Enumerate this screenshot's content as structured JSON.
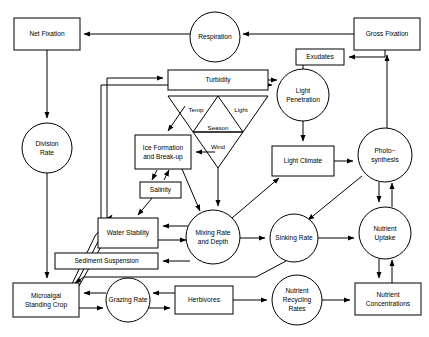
{
  "diagram": {
    "style": {
      "line_color": "#000000",
      "fill_color": "#ffffff",
      "background": "#ffffff"
    },
    "nodes": [
      {
        "id": "net_fixation",
        "label": "Net Fixation",
        "shape": "box",
        "x": 14,
        "y": 18,
        "w": 66,
        "h": 32
      },
      {
        "id": "respiration",
        "label": "Respiration",
        "shape": "circle",
        "cx": 215,
        "cy": 37,
        "r": 25
      },
      {
        "id": "gross_fixation",
        "label": "Gross Fixation",
        "shape": "box",
        "x": 354,
        "y": 18,
        "w": 66,
        "h": 32
      },
      {
        "id": "exudates",
        "label": "Exudates",
        "shape": "box",
        "x": 296,
        "y": 49,
        "w": 48,
        "h": 16
      },
      {
        "id": "turbidity",
        "label": "Turbidity",
        "shape": "box",
        "x": 168,
        "y": 70,
        "w": 100,
        "h": 20
      },
      {
        "id": "light_penetration",
        "label": "Light\nPenetration",
        "shape": "circle",
        "cx": 303,
        "cy": 95,
        "r": 26
      },
      {
        "id": "division_rate",
        "label": "Division\nRate",
        "shape": "circle",
        "cx": 47,
        "cy": 148,
        "r": 25
      },
      {
        "id": "ice_formation",
        "label": "Ice Formation\nand Break-up",
        "shape": "box",
        "x": 135,
        "y": 135,
        "w": 56,
        "h": 34
      },
      {
        "id": "light_climate",
        "label": "Light Climate",
        "shape": "box",
        "x": 272,
        "y": 146,
        "w": 62,
        "h": 30
      },
      {
        "id": "photosynthesis",
        "label": "Photo−\nsynthesis",
        "shape": "circle",
        "cx": 385,
        "cy": 155,
        "r": 27
      },
      {
        "id": "salinity",
        "label": "Salinity",
        "shape": "box",
        "x": 140,
        "y": 182,
        "w": 41,
        "h": 16
      },
      {
        "id": "water_stability",
        "label": "Water Stability",
        "shape": "box",
        "x": 98,
        "y": 218,
        "w": 60,
        "h": 30
      },
      {
        "id": "mixing_rate",
        "label": "Mixing Rate\nand Depth",
        "shape": "circle",
        "cx": 213,
        "cy": 237,
        "r": 27
      },
      {
        "id": "sinking_rate",
        "label": "Sinking Rate",
        "shape": "circle",
        "cx": 294,
        "cy": 238,
        "r": 24
      },
      {
        "id": "nutrient_uptake",
        "label": "Nutrient\nUptake",
        "shape": "circle",
        "cx": 385,
        "cy": 233,
        "r": 26
      },
      {
        "id": "sediment_suspension",
        "label": "Sediment Suspension",
        "shape": "box",
        "x": 55,
        "y": 253,
        "w": 103,
        "h": 16
      },
      {
        "id": "microalgal_standing_crop",
        "label": "Microalgal\nStanding Crop",
        "shape": "box",
        "x": 13,
        "y": 283,
        "w": 66,
        "h": 34
      },
      {
        "id": "grazing_rate",
        "label": "Grazing Rate",
        "shape": "circle",
        "cx": 128,
        "cy": 300,
        "r": 22
      },
      {
        "id": "herbivores",
        "label": "Herbivores",
        "shape": "box",
        "x": 175,
        "y": 286,
        "w": 58,
        "h": 28
      },
      {
        "id": "nutrient_recycling",
        "label": "Nutrient\nRecycling\nRates",
        "shape": "circle",
        "cx": 297,
        "cy": 300,
        "r": 25
      },
      {
        "id": "nutrient_concentrations",
        "label": "Nutrient\nConcentrations",
        "shape": "box",
        "x": 355,
        "y": 283,
        "w": 66,
        "h": 32
      }
    ],
    "triangle_labels": [
      {
        "id": "temp",
        "label": "Temp",
        "x": 196,
        "y": 110
      },
      {
        "id": "light",
        "label": "Light",
        "x": 241,
        "y": 110
      },
      {
        "id": "season",
        "label": "Season",
        "x": 218,
        "y": 128
      },
      {
        "id": "wind",
        "label": "Wind",
        "x": 218,
        "y": 147
      }
    ],
    "edges": [
      {
        "from": "gross_fixation",
        "to": "respiration"
      },
      {
        "from": "respiration",
        "to": "net_fixation"
      },
      {
        "from": "gross_fixation",
        "to": "exudates"
      },
      {
        "from": "photosynthesis",
        "to": "gross_fixation"
      },
      {
        "from": "exudates",
        "to": "light_penetration"
      },
      {
        "from": "net_fixation",
        "to": "division_rate"
      },
      {
        "from": "division_rate",
        "to": "microalgal_standing_crop"
      },
      {
        "from": "turbidity",
        "to": "light_penetration"
      },
      {
        "from": "light_penetration",
        "to": "light_climate"
      },
      {
        "from": "light_climate",
        "to": "photosynthesis"
      },
      {
        "from": "photosynthesis",
        "to": "nutrient_uptake"
      },
      {
        "from": "nutrient_uptake",
        "to": "photosynthesis"
      },
      {
        "from": "nutrient_uptake",
        "to": "nutrient_concentrations"
      },
      {
        "from": "nutrient_concentrations",
        "to": "nutrient_uptake"
      },
      {
        "from": "season",
        "to": "ice_formation"
      },
      {
        "from": "season",
        "to": "mixing_rate"
      },
      {
        "from": "wind",
        "to": "ice_formation"
      },
      {
        "from": "ice_formation",
        "to": "salinity"
      },
      {
        "from": "salinity",
        "to": "ice_formation"
      },
      {
        "from": "salinity",
        "to": "water_stability"
      },
      {
        "from": "ice_formation",
        "to": "mixing_rate"
      },
      {
        "from": "mixing_rate",
        "to": "water_stability"
      },
      {
        "from": "water_stability",
        "to": "mixing_rate"
      },
      {
        "from": "mixing_rate",
        "to": "sediment_suspension"
      },
      {
        "from": "mixing_rate",
        "to": "sinking_rate"
      },
      {
        "from": "mixing_rate",
        "to": "light_climate"
      },
      {
        "from": "sinking_rate",
        "to": "nutrient_uptake"
      },
      {
        "from": "photosynthesis",
        "to": "sinking_rate"
      },
      {
        "from": "sinking_rate",
        "to": "microalgal_standing_crop"
      },
      {
        "from": "microalgal_standing_crop",
        "to": "turbidity"
      },
      {
        "from": "microalgal_standing_crop",
        "to": "light_penetration"
      },
      {
        "from": "microalgal_standing_crop",
        "to": "water_stability"
      },
      {
        "from": "microalgal_standing_crop",
        "to": "grazing_rate"
      },
      {
        "from": "grazing_rate",
        "to": "microalgal_standing_crop"
      },
      {
        "from": "grazing_rate",
        "to": "herbivores"
      },
      {
        "from": "herbivores",
        "to": "grazing_rate"
      },
      {
        "from": "herbivores",
        "to": "nutrient_recycling"
      },
      {
        "from": "nutrient_recycling",
        "to": "nutrient_concentrations"
      }
    ]
  }
}
